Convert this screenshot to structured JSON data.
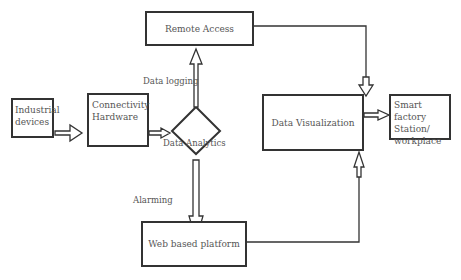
{
  "diagram": {
    "nodes": {
      "industrial": {
        "line1": "Industrial",
        "line2": "devices"
      },
      "connectivity": {
        "line1": "Connectivity",
        "line2": "Hardware"
      },
      "remote": {
        "label": "Remote Access"
      },
      "visualization": {
        "label": "Data Visualization"
      },
      "smart": {
        "line1": "Smart factory",
        "line2": "Station/",
        "line3": "workplace"
      },
      "web": {
        "label": "Web based platform"
      }
    },
    "labels": {
      "data_logging": "Data logging",
      "data_analytics": "Data Analytics",
      "alarming": "Alarming"
    }
  }
}
